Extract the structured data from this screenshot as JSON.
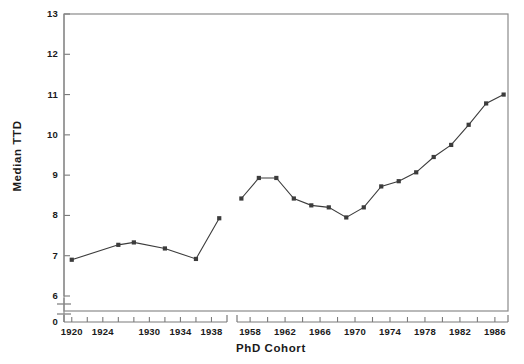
{
  "chart_data": {
    "type": "line",
    "title": "",
    "subtitle": "",
    "xlabel": "PhD Cohort",
    "ylabel": "Median TTD",
    "grid": false,
    "legend": "none",
    "ylim": [
      6,
      13
    ],
    "y_ticks": [
      6,
      7,
      8,
      9,
      10,
      11,
      12,
      13
    ],
    "y_axis_break": true,
    "y_axis_break_label": "0",
    "x_axis_break": true,
    "x_segments": [
      {
        "name": "early-cohorts",
        "xlim": [
          1919,
          1940
        ],
        "tick_step": 2,
        "ticks": [
          1920,
          1922,
          1924,
          1926,
          1928,
          1930,
          1932,
          1934,
          1936,
          1938
        ],
        "tick_labels": [
          "1920",
          "",
          "1924",
          "",
          "",
          "1930",
          "",
          "1934",
          "",
          "1938"
        ]
      },
      {
        "name": "modern-cohorts",
        "xlim": [
          1956.5,
          1987.5
        ],
        "tick_step": 2,
        "ticks": [
          1958,
          1960,
          1962,
          1964,
          1966,
          1968,
          1970,
          1972,
          1974,
          1976,
          1978,
          1980,
          1982,
          1984,
          1986
        ],
        "tick_labels": [
          "1958",
          "",
          "1962",
          "",
          "1966",
          "",
          "1970",
          "",
          "1974",
          "",
          "1978",
          "",
          "1982",
          "",
          "1986"
        ]
      }
    ],
    "series": [
      {
        "name": "Median TTD (early cohorts)",
        "segment": "early-cohorts",
        "marker": "square",
        "color": "#3c3c3c",
        "x": [
          1920,
          1926,
          1928,
          1932,
          1936,
          1939
        ],
        "values": [
          6.9,
          7.27,
          7.33,
          7.18,
          6.92,
          7.93
        ]
      },
      {
        "name": "Median TTD (modern cohorts)",
        "segment": "modern-cohorts",
        "marker": "square",
        "color": "#3c3c3c",
        "x": [
          1957,
          1959,
          1961,
          1963,
          1965,
          1967,
          1969,
          1971,
          1973,
          1975,
          1977,
          1979,
          1981,
          1983,
          1985,
          1987
        ],
        "values": [
          8.42,
          8.93,
          8.93,
          8.42,
          8.25,
          8.2,
          7.95,
          8.2,
          8.72,
          8.85,
          9.07,
          9.45,
          9.75,
          10.25,
          10.78,
          11.0
        ]
      }
    ],
    "caption": ""
  },
  "axes": {
    "x_title": "PhD Cohort",
    "y_title": "Median TTD"
  }
}
